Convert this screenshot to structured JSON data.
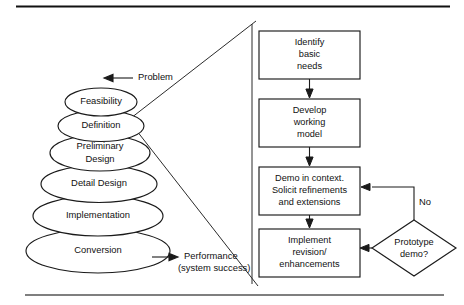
{
  "figure": {
    "colors": {
      "stroke": "#1a1a1a",
      "background": "#ffffff",
      "rule_top": "#111111",
      "rule_bottom": "#555555"
    }
  },
  "left_panel": {
    "name": "waterfall-stack",
    "stack": [
      {
        "label": "Feasibility"
      },
      {
        "label": "Definition"
      },
      {
        "label_line1": "Preliminary",
        "label_line2": "Design"
      },
      {
        "label": "Detail Design"
      },
      {
        "label": "Implementation"
      },
      {
        "label": "Conversion"
      }
    ],
    "annotations": {
      "input": {
        "label": "Problem",
        "arrow": "arrow-left"
      },
      "output": {
        "label_line1": "Performance",
        "label_line2": "(system success)",
        "arrow": "arrow-right"
      }
    }
  },
  "right_panel": {
    "name": "prototyping-flowchart",
    "boxes": [
      {
        "id": "identify",
        "line1": "Identify",
        "line2": "basic",
        "line3": "needs"
      },
      {
        "id": "develop",
        "line1": "Develop",
        "line2": "working",
        "line3": "model"
      },
      {
        "id": "demo",
        "line1": "Demo in context.",
        "line2": "Solicit refinements",
        "line3": "and extensions"
      },
      {
        "id": "implement",
        "line1": "Implement",
        "line2": "revision/",
        "line3": "enhancements"
      }
    ],
    "decision": {
      "id": "prototype-demo",
      "line1": "Prototype",
      "line2": "demo?"
    },
    "edge_labels": [
      {
        "id": "no-branch",
        "label": "No"
      }
    ]
  }
}
